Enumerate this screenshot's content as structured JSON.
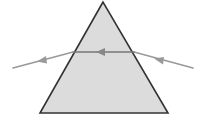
{
  "diagram": {
    "prism": {
      "apex": [
        103,
        2
      ],
      "base_left": [
        40,
        113
      ],
      "base_right": [
        168,
        113
      ],
      "fill": "#dcdcdc",
      "stroke": "#333333"
    },
    "ray": {
      "color": "#999999",
      "incident_start": [
        193,
        68
      ],
      "entry_point": [
        134,
        52
      ],
      "exit_point": [
        73,
        52
      ],
      "emergent_end": [
        13,
        68
      ],
      "arrows": [
        {
          "at": [
            160,
            60
          ],
          "direction": "left-up"
        },
        {
          "at": [
            100,
            52
          ],
          "direction": "left"
        },
        {
          "at": [
            42,
            60
          ],
          "direction": "left-down"
        }
      ]
    }
  }
}
